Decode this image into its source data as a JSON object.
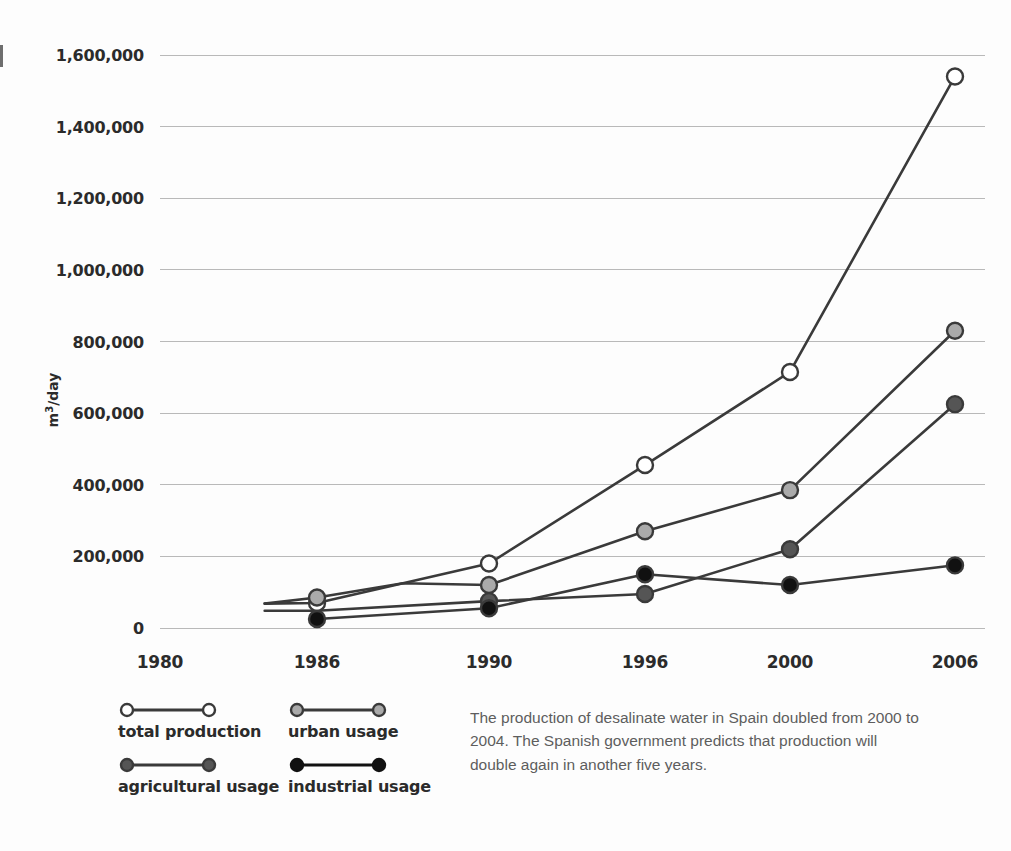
{
  "axis": {
    "ylabel": "m³/day",
    "ylabel_base": "m",
    "ylabel_sup": "3",
    "ylabel_tail": "/day"
  },
  "legend": {
    "items": [
      {
        "key": "total",
        "label": "total production",
        "fill": "#ffffff",
        "stroke": "#3a3a3a"
      },
      {
        "key": "urban",
        "label": "urban usage",
        "fill": "#aaaaaa",
        "stroke": "#3a3a3a"
      },
      {
        "key": "agricultural",
        "label": "agricultural usage",
        "fill": "#555555",
        "stroke": "#3a3a3a"
      },
      {
        "key": "industrial",
        "label": "industrial usage",
        "fill": "#111111",
        "stroke": "#111111"
      }
    ]
  },
  "caption": {
    "text": "The production of desalinate water in Spain doubled from 2000 to 2004. The Spanish government predicts that production will double again in another five years."
  },
  "chart_data": {
    "type": "line",
    "title": "",
    "xlabel": "",
    "ylabel": "m³/day",
    "categories": [
      "1980",
      "1986",
      "1990",
      "1996",
      "2000",
      "2006"
    ],
    "x_positions": [
      1980,
      1986,
      1990,
      1996,
      2000,
      2006
    ],
    "ylim": [
      0,
      1600000
    ],
    "ytick_labels": [
      "0",
      "200,000",
      "400,000",
      "600,000",
      "800,000",
      "1,000,000",
      "1,200,000",
      "1,400,000",
      "1,600,000"
    ],
    "ytick_values": [
      0,
      200000,
      400000,
      600000,
      800000,
      1000000,
      1200000,
      1400000,
      1600000
    ],
    "grid": true,
    "legend_position": "below-left",
    "line_color": "#3a3a3a",
    "series": [
      {
        "name": "total production",
        "marker_fill": "#ffffff",
        "x": [
          "1984",
          "1986",
          "1990",
          "1996",
          "2000",
          "2006"
        ],
        "values": [
          68000,
          70000,
          180000,
          455000,
          715000,
          1540000
        ],
        "markers": [
          false,
          true,
          true,
          true,
          true,
          true
        ]
      },
      {
        "name": "urban usage",
        "marker_fill": "#aaaaaa",
        "x": [
          "1984",
          "1986",
          "1988",
          "1990",
          "1996",
          "2000",
          "2006"
        ],
        "values": [
          68000,
          85000,
          125000,
          120000,
          270000,
          385000,
          830000
        ],
        "markers": [
          false,
          true,
          false,
          true,
          true,
          true,
          true
        ]
      },
      {
        "name": "agricultural usage",
        "marker_fill": "#555555",
        "x": [
          "1984",
          "1986",
          "1990",
          "1996",
          "2000",
          "2006"
        ],
        "values": [
          48000,
          48000,
          75000,
          95000,
          220000,
          625000
        ],
        "markers": [
          false,
          false,
          true,
          true,
          true,
          true
        ]
      },
      {
        "name": "industrial usage",
        "marker_fill": "#111111",
        "x": [
          "1986",
          "1990",
          "1996",
          "2000",
          "2006"
        ],
        "values": [
          25000,
          55000,
          150000,
          120000,
          175000
        ],
        "markers": [
          true,
          true,
          true,
          true,
          true
        ]
      }
    ]
  }
}
